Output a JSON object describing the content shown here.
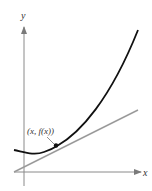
{
  "diagram": {
    "type": "tangent-line-to-curve",
    "axes": {
      "x_label": "x",
      "y_label": "y"
    },
    "point_label": "(x, f(x))",
    "colors": {
      "curve": "#111111",
      "tangent": "#9a9a9a",
      "axis": "#8a8a8a",
      "point": "#111111"
    }
  }
}
